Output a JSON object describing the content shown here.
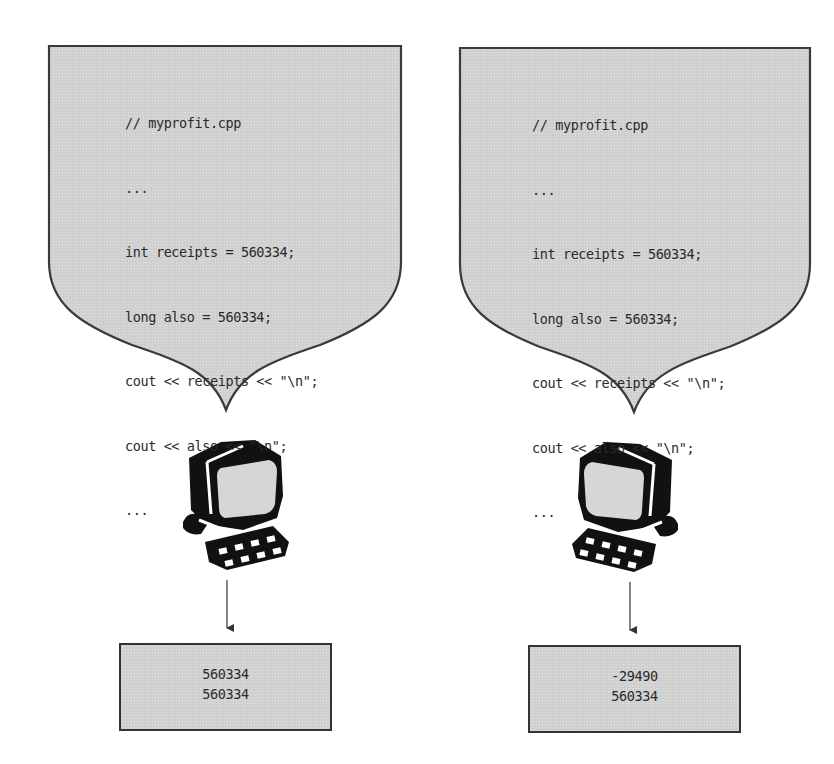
{
  "colors": {
    "panel_fill": "#d4d4d4",
    "outline": "#3a3a3a",
    "text": "#2a2a2a",
    "background": "#ffffff"
  },
  "left": {
    "code": {
      "lines": [
        "// myprofit.cpp",
        "...",
        "int receipts = 560334;",
        "long also = 560334;",
        "cout << receipts << \"\\n\";",
        "cout << also << \"\\n\";",
        "..."
      ]
    },
    "computer_icon": "computer-icon",
    "output": {
      "lines": [
        "560334",
        "560334"
      ]
    }
  },
  "right": {
    "code": {
      "lines": [
        "// myprofit.cpp",
        "...",
        "int receipts = 560334;",
        "long also = 560334;",
        "cout << receipts << \"\\n\";",
        "cout << also << \"\\n\";",
        "..."
      ]
    },
    "computer_icon": "computer-icon",
    "output": {
      "lines": [
        "-29490",
        "560334"
      ]
    }
  }
}
